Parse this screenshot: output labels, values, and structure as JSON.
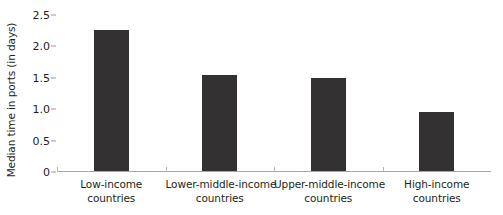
{
  "chart_data": {
    "type": "bar",
    "title": "",
    "xlabel": "",
    "ylabel": "Median time in ports (in days)",
    "categories": [
      "Low-income countries",
      "Lower-middle-income countries",
      "Upper-middle-income countries",
      "High-income countries"
    ],
    "category_lines": [
      [
        "Low-income",
        "countries"
      ],
      [
        "Lower-middle-income",
        "countries"
      ],
      [
        "Upper-middle-income",
        "countries"
      ],
      [
        "High-income",
        "countries"
      ]
    ],
    "values": [
      2.25,
      1.53,
      1.48,
      0.94
    ],
    "ylim": [
      0,
      2.5
    ],
    "ytick_labels": [
      "0",
      "0.5",
      "1.0",
      "1.5",
      "2.0",
      "2.5"
    ],
    "ytick_values": [
      0,
      0.5,
      1.0,
      1.5,
      2.0,
      2.5
    ],
    "grid": false,
    "legend": null,
    "bar_color": "#333132",
    "axis_color": "#a7a7a7",
    "background_color": "#ffffff"
  }
}
